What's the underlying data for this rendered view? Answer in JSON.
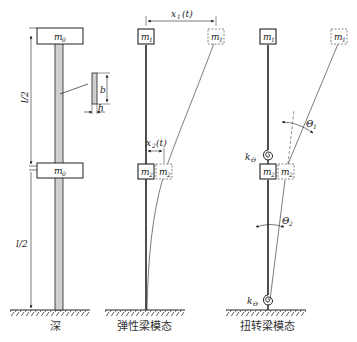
{
  "diagram": {
    "panels": [
      {
        "id": "physical",
        "caption": "深",
        "labels": {
          "mass_top": "m",
          "mass_top_sub": "0",
          "mass_mid": "m",
          "mass_mid_sub": "0",
          "length_upper": "l/2",
          "length_lower": "l/2",
          "section_b": "b",
          "section_h": "h"
        }
      },
      {
        "id": "elastic-beam-mode",
        "caption": "弹性梁模态",
        "labels": {
          "mass_top": "m",
          "mass_top_sub": "1",
          "mass_top_disp": "m",
          "mass_top_disp_sub": "1",
          "mass_mid": "m",
          "mass_mid_sub": "2",
          "mass_mid_disp": "m",
          "mass_mid_disp_sub": "2",
          "x1": "x",
          "x1_sub": "1",
          "x1_arg": "(t)",
          "x2": "x",
          "x2_sub": "2",
          "x2_arg": "(t)"
        }
      },
      {
        "id": "torsion-beam-mode",
        "caption": "扭转梁模态",
        "labels": {
          "mass_top": "m",
          "mass_top_sub": "1",
          "mass_top_disp": "m",
          "mass_top_disp_sub": "1",
          "mass_mid": "m",
          "mass_mid_sub": "2",
          "mass_mid_disp": "m",
          "mass_mid_disp_sub": "2",
          "spring_upper": "k",
          "spring_upper_sub": "Θ",
          "spring_lower": "k",
          "spring_lower_sub": "Θ",
          "theta1": "Θ",
          "theta1_sub": "1",
          "theta2": "Θ",
          "theta2_sub": "2"
        }
      }
    ]
  }
}
